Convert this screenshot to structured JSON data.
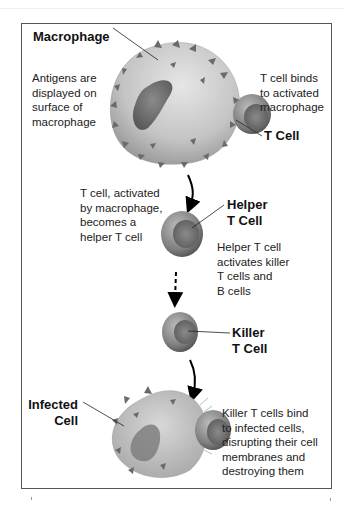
{
  "diagram": {
    "labels": {
      "macrophage": "Macrophage",
      "t_cell": "T Cell",
      "helper_t_cell": "Helper\nT Cell",
      "killer_t_cell": "Killer\nT Cell",
      "infected_cell": "Infected\nCell"
    },
    "captions": {
      "antigens": "Antigens are\ndisplayed on\nsurface of\nmacrophage",
      "t_cell_binds": "T cell binds\nto activated\nmacrophage",
      "t_cell_activated": "T cell, activated\nby macrophage,\nbecomes a\nhelper T cell",
      "helper_activates": "Helper T cell\nactivates killer\nT cells and\nB cells",
      "killer_binds": "Killer T cells bind\nto infected cells,\ndisrupting their cell\nmembranes and\ndestroying them"
    },
    "arrows": [
      {
        "from": "macrophage",
        "to": "helper_t_cell",
        "style": "solid"
      },
      {
        "from": "helper_t_cell",
        "to": "killer_t_cell",
        "style": "dashed"
      },
      {
        "from": "killer_t_cell",
        "to": "infected_cell",
        "style": "solid"
      }
    ],
    "colors": {
      "frame": "#555555",
      "cell_fill": "#b8b8b8",
      "text": "#222222"
    }
  }
}
